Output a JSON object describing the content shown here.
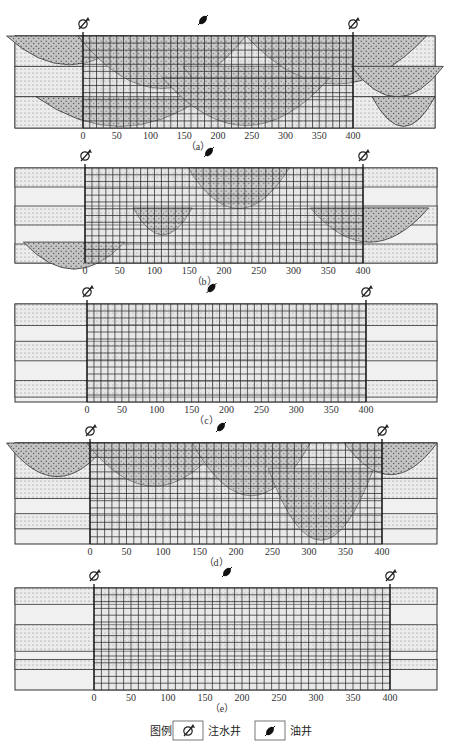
{
  "figure": {
    "x_axis_ticks": [
      "0",
      "50",
      "100",
      "150",
      "200",
      "250",
      "300",
      "350",
      "400"
    ],
    "panels": [
      {
        "id": "a",
        "caption": "（a）",
        "frame": [
          15,
          36,
          435,
          128
        ],
        "grid": [
          83,
          353
        ]
      },
      {
        "id": "b",
        "caption": "（b）",
        "frame": [
          15,
          168,
          437,
          263
        ],
        "grid": [
          85,
          363
        ]
      },
      {
        "id": "c",
        "caption": "（c）",
        "frame": [
          15,
          304,
          437,
          402
        ],
        "grid": [
          87,
          366
        ]
      },
      {
        "id": "d",
        "caption": "（d）",
        "frame": [
          15,
          443,
          437,
          544
        ],
        "grid": [
          90,
          382
        ]
      },
      {
        "id": "e",
        "caption": "（e）",
        "frame": [
          15,
          588,
          437,
          690
        ],
        "grid": [
          94,
          390
        ]
      }
    ],
    "wells": {
      "injection_left": "water-injection-well",
      "producer_center": "oil-well",
      "injection_right": "water-injection-well"
    }
  },
  "legend": {
    "title": "图例",
    "items": [
      {
        "icon": "water-injection-well-icon",
        "label": "注水井"
      },
      {
        "icon": "oil-well-icon",
        "label": "油井"
      }
    ]
  },
  "colors": {
    "frame": "#333333",
    "sand_dotted": "#e6e6e6",
    "shale": "#f0f0f0",
    "channel_fill": "#b8b8b8",
    "grid_line": "#222222"
  }
}
